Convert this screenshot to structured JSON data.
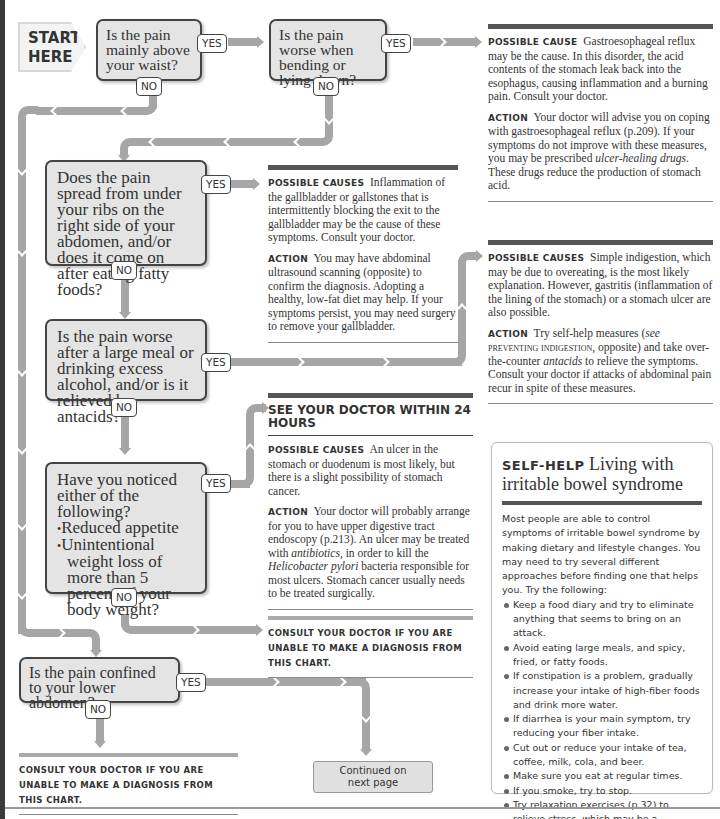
{
  "start": {
    "line1": "START",
    "line2": "HERE"
  },
  "labels": {
    "yes": "YES",
    "no": "NO"
  },
  "questions": [
    {
      "id": "q1",
      "text": "Is the pain mainly above your waist?"
    },
    {
      "id": "q2",
      "text": "Is the pain worse when bending or lying down?"
    },
    {
      "id": "q3",
      "text": "Does the pain spread from under your ribs on the right side of your abdomen, and/or does it come on after eating fatty foods?"
    },
    {
      "id": "q4",
      "text": "Is the pain worse after a large meal or drinking excess alcohol, and/or is it relieved by antacids?"
    },
    {
      "id": "q5",
      "text": "Have you noticed either of the following?",
      "bullets": [
        "Reduced appetite",
        "Unintentional weight loss of more than 5 percent of your body weight?"
      ]
    },
    {
      "id": "q6",
      "text": "Is the pain confined to your lower abdomen?"
    }
  ],
  "outcomes": {
    "reflux": {
      "cause_label": "Possible cause",
      "cause_text": "Gastroesophageal reflux may be the cause. In this disorder, the acid contents of the stomach leak back into the esophagus, causing inflammation and a burning pain. Consult your doctor.",
      "action_label": "Action",
      "action_text_1": "Your doctor will advise you on coping with gastroesophageal reflux (p.209). If your symptoms do not improve with these measures, you may be prescribed ",
      "action_em_1": "ulcer-healing drugs",
      "action_text_2": ". These drugs reduce the production of stomach acid."
    },
    "gallbladder": {
      "cause_label": "Possible causes",
      "cause_text": "Inflammation of the gallbladder or gallstones that is intermittently blocking the exit to the gallbladder may be the cause of these symptoms. Consult your doctor.",
      "action_label": "Action",
      "action_text": "You may have abdominal ultrasound scanning (opposite) to confirm the diagnosis. Adopting a healthy, low-fat diet may help. If your symptoms persist, you may need surgery to remove your gallbladder."
    },
    "indigestion": {
      "cause_label": "Possible causes",
      "cause_text": "Simple indigestion, which may be due to overeating, is the most likely explanation. However, gastritis (inflammation of the lining of the stomach) or a stomach ulcer are also possible.",
      "action_label": "Action",
      "action_text_1": "Try self-help measures (",
      "action_see": "see",
      "action_ref": "Preventing indigestion",
      "action_text_2": ", opposite) and take over-the-counter ",
      "action_em": "antacids",
      "action_text_3": " to relieve the symptoms. Consult your doctor if attacks of abdominal pain recur in spite of these measures."
    },
    "ulcer": {
      "headline": "SEE YOUR DOCTOR WITHIN 24 HOURS",
      "cause_label": "Possible causes",
      "cause_text": "An ulcer in the stomach or duodenum is most likely, but there is a slight possibility of stomach cancer.",
      "action_label": "Action",
      "action_text_1": "Your doctor will probably arrange for you to have upper digestive tract endoscopy (p.213). An ulcer may be treated with ",
      "action_em_1": "antibiotics",
      "action_text_2": ", in order to kill the ",
      "action_em_2": "Helicobacter pylori",
      "action_text_3": " bacteria responsible for most ulcers. Stomach cancer usually needs to be treated surgically."
    },
    "consult_mid": "Consult your doctor if you are unable to make a diagnosis from this chart.",
    "consult_bottom": "Consult your doctor if you are unable to make a diagnosis from this chart."
  },
  "continued": {
    "line1": "Continued on",
    "line2": "next page"
  },
  "selfhelp": {
    "tag": "SELF-HELP",
    "title": "Living with irritable bowel syndrome",
    "intro": "Most people are able to control symptoms of irritable bowel syndrome by making dietary and lifestyle changes. You may need to try several different approaches before finding one that helps you. Try the following:",
    "items": [
      "Keep a food diary and try to eliminate anything that seems to bring on an attack.",
      "Avoid eating large meals, and spicy, fried, or fatty foods.",
      "If constipation is a problem, gradually increase your intake of high-fiber foods and drink more water.",
      "If diarrhea is your main symptom, try reducing your fiber intake.",
      "Cut out or reduce your intake of tea, coffee, milk, cola, and beer.",
      "Make sure you eat at regular times.",
      "If you smoke, try to stop.",
      "Try relaxation exercises (p.32) to relieve stress, which may be a contributing factor."
    ]
  },
  "colors": {
    "box_fill": "#e4e4e4",
    "box_border": "#444444",
    "connector": "#a6a6a6",
    "rule_dark": "#555555"
  }
}
